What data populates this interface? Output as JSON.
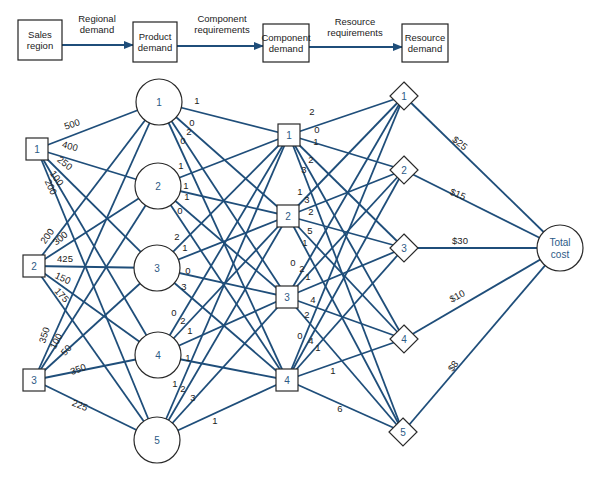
{
  "header_flow": {
    "boxes": [
      {
        "id": "sales",
        "lines": [
          "Sales",
          "region"
        ],
        "x": 18,
        "y": 20,
        "w": 44,
        "h": 40
      },
      {
        "id": "product",
        "lines": [
          "Product",
          "demand"
        ],
        "x": 133,
        "y": 22,
        "w": 44,
        "h": 40
      },
      {
        "id": "component",
        "lines": [
          "Component",
          "demand"
        ],
        "x": 263,
        "y": 24,
        "w": 46,
        "h": 38
      },
      {
        "id": "resource",
        "lines": [
          "Resource",
          "demand"
        ],
        "x": 402,
        "y": 24,
        "w": 46,
        "h": 38
      }
    ],
    "arrows": [
      {
        "from_x": 62,
        "to_x": 133,
        "y": 45,
        "lines": [
          "Regional",
          "demand"
        ],
        "lx": 97,
        "ly": 22
      },
      {
        "from_x": 177,
        "to_x": 263,
        "y": 46,
        "lines": [
          "Component",
          "requirements"
        ],
        "lx": 222,
        "ly": 22
      },
      {
        "from_x": 309,
        "to_x": 402,
        "y": 47,
        "lines": [
          "Resource",
          "requirements"
        ],
        "lx": 355,
        "ly": 25
      }
    ]
  },
  "nodes": {
    "sales": [
      {
        "label": "1",
        "x": 37,
        "y": 149,
        "w": 22,
        "h": 22
      },
      {
        "label": "2",
        "x": 34,
        "y": 266,
        "w": 22,
        "h": 22
      },
      {
        "label": "3",
        "x": 34,
        "y": 380,
        "w": 22,
        "h": 22
      }
    ],
    "products": [
      {
        "label": "1",
        "x": 159,
        "y": 102,
        "r": 23
      },
      {
        "label": "2",
        "x": 158,
        "y": 186,
        "r": 23
      },
      {
        "label": "3",
        "x": 157,
        "y": 268,
        "r": 23
      },
      {
        "label": "4",
        "x": 158,
        "y": 355,
        "r": 23
      },
      {
        "label": "5",
        "x": 157,
        "y": 440,
        "r": 23
      }
    ],
    "components": [
      {
        "label": "1",
        "x": 289,
        "y": 135,
        "w": 22,
        "h": 22
      },
      {
        "label": "2",
        "x": 288,
        "y": 216,
        "w": 22,
        "h": 22
      },
      {
        "label": "3",
        "x": 287,
        "y": 297,
        "w": 22,
        "h": 22
      },
      {
        "label": "4",
        "x": 287,
        "y": 380,
        "w": 22,
        "h": 22
      }
    ],
    "resources": [
      {
        "label": "1",
        "x": 404,
        "y": 96,
        "s": 14
      },
      {
        "label": "2",
        "x": 404,
        "y": 170,
        "s": 14
      },
      {
        "label": "3",
        "x": 404,
        "y": 248,
        "s": 14
      },
      {
        "label": "4",
        "x": 404,
        "y": 339,
        "s": 14
      },
      {
        "label": "5",
        "x": 403,
        "y": 432,
        "s": 14
      }
    ],
    "total_cost": {
      "lines": [
        "Total",
        "cost"
      ],
      "x": 560,
      "y": 248,
      "r": 23
    }
  },
  "edges_sales_product": [
    {
      "s": 0,
      "p": 0,
      "label": "500",
      "lx": 72,
      "ly": 124,
      "rot": -18
    },
    {
      "s": 0,
      "p": 1,
      "label": "400",
      "lx": 70,
      "ly": 146,
      "rot": 15
    },
    {
      "s": 0,
      "p": 2,
      "label": "250",
      "lx": 65,
      "ly": 163,
      "rot": 38
    },
    {
      "s": 0,
      "p": 3,
      "label": "100",
      "lx": 57,
      "ly": 178,
      "rot": 55
    },
    {
      "s": 0,
      "p": 4,
      "label": "200",
      "lx": 51,
      "ly": 187,
      "rot": 65
    },
    {
      "s": 1,
      "p": 0,
      "label": "200",
      "lx": 47,
      "ly": 236,
      "rot": -55
    },
    {
      "s": 1,
      "p": 1,
      "label": "300",
      "lx": 60,
      "ly": 238,
      "rot": -40
    },
    {
      "s": 1,
      "p": 2,
      "label": "425",
      "lx": 65,
      "ly": 258,
      "rot": 0
    },
    {
      "s": 1,
      "p": 3,
      "label": "150",
      "lx": 63,
      "ly": 278,
      "rot": 25
    },
    {
      "s": 1,
      "p": 4,
      "label": "175",
      "lx": 62,
      "ly": 295,
      "rot": 48
    },
    {
      "s": 2,
      "p": 0,
      "label": "350",
      "lx": 44,
      "ly": 335,
      "rot": -72
    },
    {
      "s": 2,
      "p": 1,
      "label": "100",
      "lx": 56,
      "ly": 341,
      "rot": -62
    },
    {
      "s": 2,
      "p": 2,
      "label": "50",
      "lx": 66,
      "ly": 350,
      "rot": -50
    },
    {
      "s": 2,
      "p": 3,
      "label": "350",
      "lx": 78,
      "ly": 369,
      "rot": -20
    },
    {
      "s": 2,
      "p": 4,
      "label": "225",
      "lx": 80,
      "ly": 405,
      "rot": 22
    }
  ],
  "edges_product_component": [
    {
      "p": 0,
      "c": 0,
      "label": "1",
      "lx": 197,
      "ly": 100,
      "rot": 0
    },
    {
      "p": 0,
      "c": 1,
      "label": "0",
      "lx": 192,
      "ly": 122,
      "rot": 0
    },
    {
      "p": 0,
      "c": 2,
      "label": "2",
      "lx": 189,
      "ly": 131,
      "rot": 0
    },
    {
      "p": 0,
      "c": 3,
      "label": "0",
      "lx": 183,
      "ly": 140,
      "rot": 0
    },
    {
      "p": 1,
      "c": 0,
      "label": "1",
      "lx": 181,
      "ly": 165,
      "rot": 0
    },
    {
      "p": 1,
      "c": 1,
      "label": "1",
      "lx": 186,
      "ly": 185,
      "rot": 0
    },
    {
      "p": 1,
      "c": 2,
      "label": "1",
      "lx": 187,
      "ly": 196,
      "rot": 0
    },
    {
      "p": 1,
      "c": 3,
      "label": "0",
      "lx": 180,
      "ly": 210,
      "rot": 0
    },
    {
      "p": 2,
      "c": 0,
      "label": "2",
      "lx": 177,
      "ly": 236,
      "rot": 0
    },
    {
      "p": 2,
      "c": 1,
      "label": "1",
      "lx": 185,
      "ly": 247,
      "rot": 0
    },
    {
      "p": 2,
      "c": 2,
      "label": "0",
      "lx": 188,
      "ly": 270,
      "rot": 0
    },
    {
      "p": 2,
      "c": 3,
      "label": "3",
      "lx": 184,
      "ly": 286,
      "rot": 0
    },
    {
      "p": 3,
      "c": 0,
      "label": "0",
      "lx": 174,
      "ly": 312,
      "rot": 0
    },
    {
      "p": 3,
      "c": 1,
      "label": "2",
      "lx": 183,
      "ly": 320,
      "rot": 0
    },
    {
      "p": 3,
      "c": 2,
      "label": "1",
      "lx": 190,
      "ly": 330,
      "rot": 0
    },
    {
      "p": 3,
      "c": 3,
      "label": "1",
      "lx": 188,
      "ly": 357,
      "rot": 0
    },
    {
      "p": 4,
      "c": 0,
      "label": "1",
      "lx": 175,
      "ly": 383,
      "rot": 0
    },
    {
      "p": 4,
      "c": 1,
      "label": "2",
      "lx": 183,
      "ly": 388,
      "rot": 0
    },
    {
      "p": 4,
      "c": 2,
      "label": "3",
      "lx": 193,
      "ly": 397,
      "rot": 0
    },
    {
      "p": 4,
      "c": 3,
      "label": "1",
      "lx": 215,
      "ly": 420,
      "rot": 0
    }
  ],
  "edges_component_resource": [
    {
      "c": 0,
      "r": 0,
      "label": "2",
      "lx": 312,
      "ly": 111,
      "rot": 0
    },
    {
      "c": 0,
      "r": 1,
      "label": "0",
      "lx": 317,
      "ly": 129,
      "rot": 0
    },
    {
      "c": 0,
      "r": 2,
      "label": "1",
      "lx": 316,
      "ly": 141,
      "rot": 0
    },
    {
      "c": 0,
      "r": 3,
      "label": "2",
      "lx": 311,
      "ly": 159,
      "rot": 0
    },
    {
      "c": 0,
      "r": 4,
      "label": "3",
      "lx": 304,
      "ly": 169,
      "rot": 0
    },
    {
      "c": 1,
      "r": 0,
      "label": "1",
      "lx": 300,
      "ly": 191,
      "rot": 0
    },
    {
      "c": 1,
      "r": 1,
      "label": "3",
      "lx": 307,
      "ly": 199,
      "rot": 0
    },
    {
      "c": 1,
      "r": 2,
      "label": "2",
      "lx": 311,
      "ly": 211,
      "rot": 0
    },
    {
      "c": 1,
      "r": 3,
      "label": "5",
      "lx": 310,
      "ly": 230,
      "rot": 0
    },
    {
      "c": 1,
      "r": 4,
      "label": "1",
      "lx": 305,
      "ly": 242,
      "rot": 0
    },
    {
      "c": 2,
      "r": 0,
      "label": "0",
      "lx": 293,
      "ly": 262,
      "rot": 0
    },
    {
      "c": 2,
      "r": 1,
      "label": "2",
      "lx": 302,
      "ly": 268,
      "rot": 0
    },
    {
      "c": 2,
      "r": 2,
      "label": "1",
      "lx": 308,
      "ly": 276,
      "rot": 0
    },
    {
      "c": 2,
      "r": 3,
      "label": "4",
      "lx": 313,
      "ly": 299,
      "rot": 0
    },
    {
      "c": 2,
      "r": 4,
      "label": "2",
      "lx": 307,
      "ly": 314,
      "rot": 0
    },
    {
      "c": 3,
      "r": 0,
      "label": "0",
      "lx": 300,
      "ly": 335,
      "rot": 0
    },
    {
      "c": 3,
      "r": 1,
      "label": "4",
      "lx": 311,
      "ly": 340,
      "rot": 0
    },
    {
      "c": 3,
      "r": 2,
      "label": "1",
      "lx": 318,
      "ly": 347,
      "rot": 0
    },
    {
      "c": 3,
      "r": 3,
      "label": "1",
      "lx": 333,
      "ly": 370,
      "rot": 0
    },
    {
      "c": 3,
      "r": 4,
      "label": "6",
      "lx": 340,
      "ly": 408,
      "rot": 0
    }
  ],
  "edges_resource_total": [
    {
      "r": 0,
      "label": "$25",
      "lx": 460,
      "ly": 143,
      "rot": 38
    },
    {
      "r": 1,
      "label": "$15",
      "lx": 458,
      "ly": 194,
      "rot": 22
    },
    {
      "r": 2,
      "label": "$30",
      "lx": 460,
      "ly": 240,
      "rot": 0
    },
    {
      "r": 3,
      "label": "$10",
      "lx": 457,
      "ly": 296,
      "rot": -28
    },
    {
      "r": 4,
      "label": "$8",
      "lx": 453,
      "ly": 366,
      "rot": -55
    }
  ],
  "colors": {
    "edge": "#1f4e7a",
    "node_label": "#2c5a86",
    "node_border": "#2a2a2a"
  }
}
